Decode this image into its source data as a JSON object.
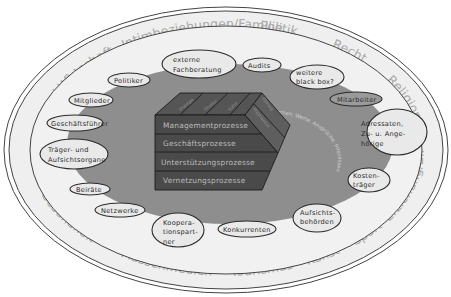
{
  "diagram": {
    "colors": {
      "outer_ring": "#efefef",
      "inner_field": "#f1f1f1",
      "gray_zone": "#8e8e8e",
      "cube_front": "#4a4a4a",
      "ring_text": "#a9a9a9",
      "ellipse_stroke": "#2b2b2b"
    },
    "outer_ring": {
      "small_labels": [
        "Natur und Technik",
        "Soziale und politische Bewegungen"
      ],
      "sectors": [
        "Intimbeziehungen/Familie",
        "Politik",
        "Recht",
        "Religion",
        "Erziehung/Bildung",
        "Sport",
        "Kunst",
        "Tourismus",
        "Massenmedien",
        "Gesundheit",
        "Wissenschaft",
        "Wirtschaft"
      ]
    },
    "stakeholders": [
      {
        "id": "externe-fachberatung",
        "lines": [
          "externe",
          "Fachberatung"
        ]
      },
      {
        "id": "audits",
        "lines": [
          "Audits"
        ]
      },
      {
        "id": "weitere-black-box",
        "lines": [
          "weitere",
          "black box?"
        ]
      },
      {
        "id": "mitarbeiter",
        "lines": [
          "Mitarbeiter"
        ]
      },
      {
        "id": "adressaten",
        "lines": [
          "Adressaten,",
          "Zu- u. Ange-",
          "hörige"
        ]
      },
      {
        "id": "kostentraeger",
        "lines": [
          "Kosten-",
          "träger"
        ]
      },
      {
        "id": "aufsichtsbehoerden",
        "lines": [
          "Aufsichts-",
          "behörden"
        ]
      },
      {
        "id": "konkurrenten",
        "lines": [
          "Konkurrenten"
        ]
      },
      {
        "id": "kooperationspartner",
        "lines": [
          "Koopera-",
          "tionspart-",
          "ner"
        ]
      },
      {
        "id": "netzwerke",
        "lines": [
          "Netzwerke"
        ]
      },
      {
        "id": "beiraete",
        "lines": [
          "Beiräte"
        ]
      },
      {
        "id": "traeger",
        "lines": [
          "Träger- und",
          "Aufsichtsorgane"
        ]
      },
      {
        "id": "geschaeftsfuehrer",
        "lines": [
          "Geschäftsführer"
        ]
      },
      {
        "id": "mitglieder",
        "lines": [
          "Mitglieder"
        ]
      },
      {
        "id": "politiker",
        "lines": [
          "Politiker"
        ]
      }
    ],
    "organization": {
      "top_labels": [
        "Strategie",
        "Struktur",
        "Kultur"
      ],
      "side_labels": [
        "Führung",
        "Organisation"
      ],
      "processes": [
        "Managementprozesse",
        "Geschäftsprozesse",
        "Unterstützungsprozesse",
        "Vernetzungsprozesse"
      ]
    },
    "inner_arc_text": "Normen, Werte, Ansprüche, Interessen"
  }
}
